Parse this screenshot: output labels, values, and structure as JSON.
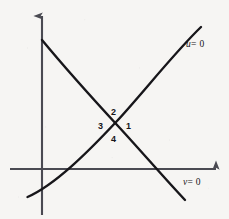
{
  "figure": {
    "kind": "phase-plane-nullcline-diagram",
    "background_color": "#f6f5f3",
    "ink_color": "#17161a",
    "axis_color": "#4a4a52"
  },
  "axes": {
    "vertical_axis": {
      "name": "vertical-axis",
      "x": 42,
      "top_y": 13,
      "bottom_y": 215,
      "has_arrow": true,
      "arrow_direction": "up"
    },
    "horizontal_axis": {
      "name": "horizontal-axis",
      "y": 169,
      "left_x": 10,
      "right_x": 219,
      "has_arrow": true,
      "arrow_direction": "right"
    }
  },
  "curves": [
    {
      "id": "u-nullcline",
      "label": "u = 0",
      "variable": "u",
      "equals": "= 0",
      "direction": "ascending",
      "shape": "concave-down",
      "path": "M 27.5,197 C 55,185 88,152 117,121 C 142,94 175,52 201,27",
      "x_axis_crossing_x": 68,
      "label_position": {
        "x": 186,
        "y": 40
      }
    },
    {
      "id": "v-nullcline",
      "label": "v = 0",
      "variable": "v",
      "equals": "= 0",
      "direction": "descending",
      "shape": "concave-up",
      "path": "M 42,40 C 66,69 94,100 118,126 C 142,152 166,180 185,200",
      "x_axis_crossing_x": 145,
      "label_position": {
        "x": 183,
        "y": 178
      }
    }
  ],
  "intersection": {
    "name": "nullcline-intersection",
    "x": 115,
    "y": 122
  },
  "region_labels": [
    {
      "id": "region-1",
      "text": "1",
      "x": 126,
      "y": 122
    },
    {
      "id": "region-2",
      "text": "2",
      "x": 111,
      "y": 108
    },
    {
      "id": "region-3",
      "text": "3",
      "x": 98,
      "y": 122
    },
    {
      "id": "region-4",
      "text": "4",
      "x": 111,
      "y": 135
    }
  ]
}
